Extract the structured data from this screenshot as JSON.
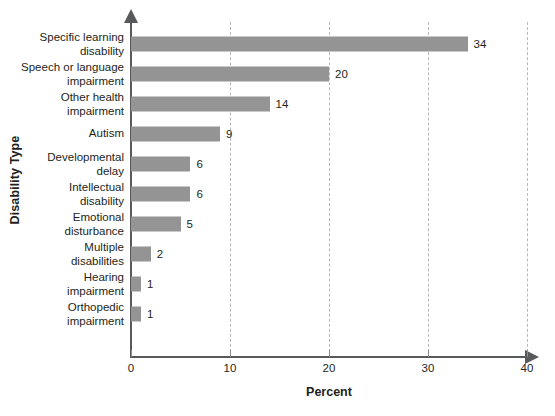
{
  "chart_data": {
    "type": "bar",
    "orientation": "horizontal",
    "title": "",
    "xlabel": "Percent",
    "ylabel": "Disability Type",
    "xlim": [
      0,
      40
    ],
    "xticks": [
      0,
      10,
      20,
      30,
      40
    ],
    "xtick_labels": [
      "0",
      "10",
      "20",
      "30",
      "40"
    ],
    "grid": "vertical-dashed",
    "legend": "none",
    "bar_color": "#949494",
    "axis_color": "#58595b",
    "gridline_color": "#b9b9b9",
    "text_color": "#231f20",
    "categories": [
      "Specific learning disability",
      "Speech or language impairment",
      "Other health impairment",
      "Autism",
      "Developmental delay",
      "Intellectual disability",
      "Emotional disturbance",
      "Multiple disabilities",
      "Hearing impairment",
      "Orthopedic impairment"
    ],
    "values": [
      34,
      20,
      14,
      9,
      6,
      6,
      5,
      2,
      1,
      1
    ],
    "value_labels": [
      "34",
      "20",
      "14",
      "9",
      "6",
      "6",
      "5",
      "2",
      "1",
      "1"
    ],
    "bars": [
      {
        "label_line1": "Specific learning",
        "label_line2": "disability",
        "value": 34,
        "value_label": "34"
      },
      {
        "label_line1": "Speech or language",
        "label_line2": "impairment",
        "value": 20,
        "value_label": "20"
      },
      {
        "label_line1": "Other health",
        "label_line2": "impairment",
        "value": 14,
        "value_label": "14"
      },
      {
        "label_line1": "Autism",
        "label_line2": "",
        "value": 9,
        "value_label": "9"
      },
      {
        "label_line1": "Developmental",
        "label_line2": "delay",
        "value": 6,
        "value_label": "6"
      },
      {
        "label_line1": "Intellectual",
        "label_line2": "disability",
        "value": 6,
        "value_label": "6"
      },
      {
        "label_line1": "Emotional",
        "label_line2": "disturbance",
        "value": 5,
        "value_label": "5"
      },
      {
        "label_line1": "Multiple",
        "label_line2": "disabilities",
        "value": 2,
        "value_label": "2"
      },
      {
        "label_line1": "Hearing",
        "label_line2": "impairment",
        "value": 1,
        "value_label": "1"
      },
      {
        "label_line1": "Orthopedic",
        "label_line2": "impairment",
        "value": 1,
        "value_label": "1"
      }
    ]
  }
}
